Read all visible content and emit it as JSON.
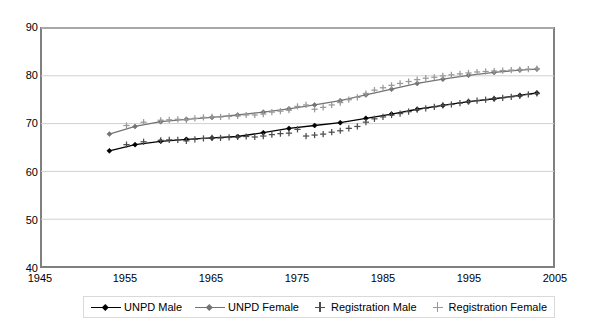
{
  "chart_data": {
    "type": "line",
    "title": "",
    "xlabel": "",
    "ylabel": "",
    "xlim": [
      1945,
      2005
    ],
    "ylim": [
      40,
      90
    ],
    "xticks": [
      1945,
      1955,
      1965,
      1975,
      1985,
      1995,
      2005
    ],
    "yticks": [
      40,
      50,
      60,
      70,
      80,
      90
    ],
    "grid": "horizontal",
    "legend_position": "bottom",
    "series": [
      {
        "name": "UNPD Male",
        "marker": "diamond",
        "line": true,
        "color": "#000000",
        "x": [
          1953,
          1956,
          1959,
          1962,
          1965,
          1968,
          1971,
          1974,
          1977,
          1980,
          1983,
          1986,
          1989,
          1992,
          1995,
          1998,
          2001,
          2003
        ],
        "y": [
          64.3,
          65.6,
          66.3,
          66.7,
          67.0,
          67.3,
          68.1,
          69.0,
          69.6,
          70.2,
          71.1,
          72.0,
          73.0,
          73.8,
          74.6,
          75.2,
          75.9,
          76.4
        ]
      },
      {
        "name": "UNPD Female",
        "marker": "diamond",
        "line": true,
        "color": "#737373",
        "x": [
          1953,
          1956,
          1959,
          1962,
          1965,
          1968,
          1971,
          1974,
          1977,
          1980,
          1983,
          1986,
          1989,
          1992,
          1995,
          1998,
          2001,
          2003
        ],
        "y": [
          67.8,
          69.4,
          70.4,
          70.9,
          71.3,
          71.8,
          72.4,
          73.1,
          73.9,
          74.8,
          76.0,
          77.2,
          78.4,
          79.3,
          80.1,
          80.7,
          81.2,
          81.4
        ]
      },
      {
        "name": "Registration Male",
        "marker": "plus",
        "line": false,
        "color": "#4d4d4d",
        "x": [
          1955,
          1957,
          1959,
          1960,
          1961,
          1962,
          1963,
          1964,
          1965,
          1966,
          1967,
          1968,
          1969,
          1970,
          1971,
          1972,
          1973,
          1974,
          1975,
          1976,
          1977,
          1978,
          1979,
          1980,
          1981,
          1982,
          1983,
          1984,
          1985,
          1986,
          1987,
          1988,
          1989,
          1990,
          1991,
          1992,
          1993,
          1994,
          1995,
          1996,
          1997,
          1998,
          1999,
          2000,
          2001,
          2002,
          2003
        ],
        "y": [
          65.6,
          66.2,
          66.5,
          66.6,
          66.6,
          66.4,
          66.7,
          66.9,
          67.0,
          67.0,
          67.1,
          67.2,
          67.3,
          67.2,
          67.4,
          67.7,
          67.9,
          68.0,
          68.8,
          67.4,
          67.6,
          67.8,
          68.2,
          68.5,
          69.0,
          69.4,
          70.3,
          71.0,
          71.4,
          71.8,
          72.1,
          72.5,
          72.9,
          73.2,
          73.5,
          73.8,
          74.0,
          74.3,
          74.6,
          74.8,
          75.0,
          75.2,
          75.4,
          75.6,
          75.8,
          76.1,
          76.3
        ]
      },
      {
        "name": "Registration Female",
        "marker": "plus",
        "line": false,
        "color": "#999999",
        "x": [
          1955,
          1957,
          1959,
          1960,
          1961,
          1962,
          1963,
          1964,
          1965,
          1966,
          1967,
          1968,
          1969,
          1970,
          1971,
          1972,
          1973,
          1974,
          1975,
          1976,
          1977,
          1978,
          1979,
          1980,
          1981,
          1982,
          1983,
          1984,
          1985,
          1986,
          1987,
          1988,
          1989,
          1990,
          1991,
          1992,
          1993,
          1994,
          1995,
          1996,
          1997,
          1998,
          1999,
          2000,
          2001,
          2002,
          2003
        ],
        "y": [
          69.6,
          70.3,
          70.7,
          70.8,
          70.9,
          70.8,
          71.1,
          71.3,
          71.4,
          71.4,
          71.5,
          71.6,
          71.8,
          71.8,
          72.0,
          72.4,
          72.6,
          72.8,
          73.6,
          73.9,
          73.0,
          73.4,
          73.9,
          74.4,
          75.0,
          75.5,
          76.3,
          77.0,
          77.5,
          78.0,
          78.4,
          78.8,
          79.2,
          79.5,
          79.7,
          80.0,
          80.2,
          80.4,
          80.6,
          80.8,
          80.9,
          81.0,
          81.1,
          81.2,
          81.3,
          81.4,
          81.5
        ]
      }
    ]
  },
  "axes": {
    "ytick_labels": [
      "90",
      "80",
      "70",
      "60",
      "50",
      "40"
    ],
    "xtick_labels": [
      "1945",
      "1955",
      "1965",
      "1975",
      "1985",
      "1995",
      "2005"
    ]
  },
  "legend": {
    "items": [
      {
        "label": "UNPD Male",
        "symbol": "line-diamond",
        "color": "#000000"
      },
      {
        "label": "UNPD Female",
        "symbol": "line-diamond",
        "color": "#737373"
      },
      {
        "label": "Registration Male",
        "symbol": "plus",
        "color": "#4d4d4d"
      },
      {
        "label": "Registration Female",
        "symbol": "plus",
        "color": "#999999"
      }
    ]
  }
}
